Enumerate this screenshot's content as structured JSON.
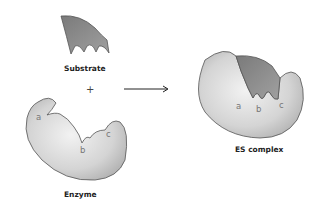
{
  "labels": {
    "substrate": "Substrate",
    "enzyme": "Enzyme",
    "es_complex": "ES complex",
    "plus": "+"
  },
  "binding_sites": {
    "enzyme": [
      "a",
      "b",
      "c"
    ],
    "es_complex": [
      "a",
      "b",
      "c"
    ]
  },
  "colors": {
    "substrate_fill": "#8a8a8a",
    "enzyme_fill": "#d6d6d6",
    "outline": "#555555",
    "arrow": "#222222"
  }
}
